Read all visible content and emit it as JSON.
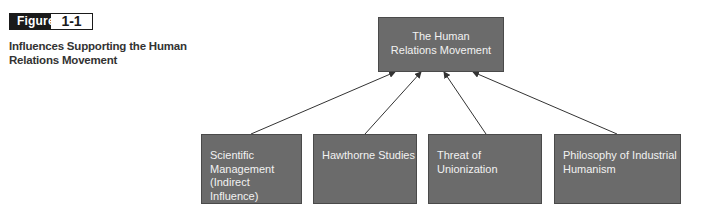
{
  "figure": {
    "label": "Figure",
    "number": "1-1",
    "caption": "Influences Supporting the Human Relations Movement"
  },
  "diagram": {
    "root": {
      "label": "The Human Relations Movement",
      "lines": [
        "The Human",
        "Relations Movement"
      ]
    },
    "influences": [
      {
        "label": "Scientific Management (Indirect Influence)",
        "lines": [
          "Scientific",
          "Management",
          "(Indirect Influence)"
        ]
      },
      {
        "label": "Hawthorne Studies",
        "lines": [
          "Hawthorne Studies"
        ]
      },
      {
        "label": "Threat of Unionization",
        "lines": [
          "Threat of Unionization"
        ]
      },
      {
        "label": "Philosophy of Industrial Humanism",
        "lines": [
          "Philosophy of Industrial",
          "Humanism"
        ]
      }
    ],
    "edges": [
      {
        "from": "Scientific Management (Indirect Influence)",
        "to": "The Human Relations Movement"
      },
      {
        "from": "Hawthorne Studies",
        "to": "The Human Relations Movement"
      },
      {
        "from": "Threat of Unionization",
        "to": "The Human Relations Movement"
      },
      {
        "from": "Philosophy of Industrial Humanism",
        "to": "The Human Relations Movement"
      }
    ],
    "colors": {
      "box_fill": "#6b6b6b",
      "box_border": "#4a4a4a",
      "box_text": "#f2f2f2",
      "arrow": "#333333"
    }
  }
}
